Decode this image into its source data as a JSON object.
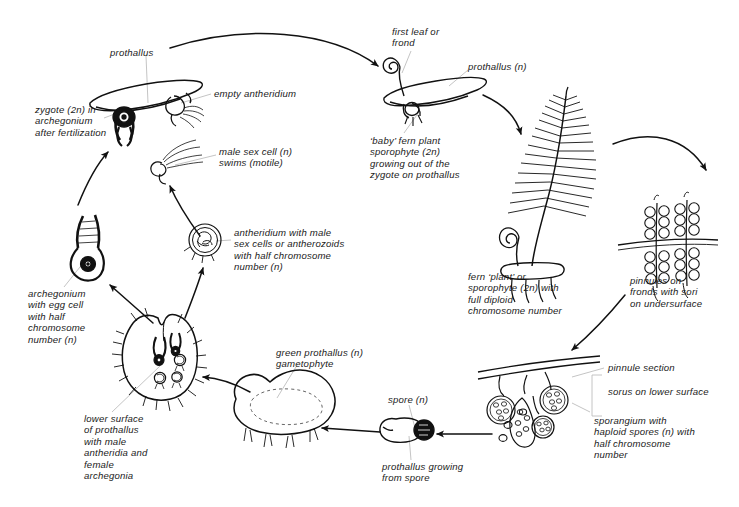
{
  "diagram": {
    "type": "biological-life-cycle-diagram",
    "ink_color": "#111111",
    "leader_color": "#b8b8b8",
    "background": "#ffffff"
  },
  "labels": {
    "prothallus": "prothallus",
    "zygote": "zygote (2n) in\narchegonium\nafter fertilization",
    "empty_antheridium": "empty antheridium",
    "male_sex_cell": "male sex cell (n)\nswims (motile)",
    "antheridium": "antheridium with male\nsex cells or antherozoids\nwith half chromosome\nnumber (n)",
    "archegonium": "archegonium\nwith egg cell\nwith half\nchromosome\nnumber (n)",
    "lower_surface": "lower surface\nof prothallus\nwith male\nantheridia and\nfemale\narchegonia",
    "green_prothallus": "green prothallus (n)\ngametophyte",
    "spore": "spore (n)",
    "prothallus_growing": "prothallus growing\nfrom spore",
    "first_leaf": "first leaf or\nfrond",
    "prothallus_n": "prothallus (n)",
    "baby_fern": "‘baby’ fern plant\nsporophyte (2n)\ngrowing out of the\nzygote on prothallus",
    "fern_plant": "fern ‘plant’ or\nsporophyte (2n) with\nfull diploid\nchromosome number",
    "pinnules": "pinnules on\nfronds with sori\non undersurface",
    "pinnule_section": "pinnule section",
    "sorus": "sorus on lower surface",
    "sporangium": "sporangium with\nhaploid spores (n) with\nhalf chromosome\nnumber"
  },
  "structures": [
    {
      "name": "prothallus-with-zygote",
      "stage": "gametophyte",
      "ploidy": "2n zygote"
    },
    {
      "name": "male-sex-cell",
      "stage": "gamete",
      "ploidy": "n"
    },
    {
      "name": "antheridium",
      "stage": "gametophyte-organ",
      "ploidy": "n"
    },
    {
      "name": "archegonium",
      "stage": "gametophyte-organ",
      "ploidy": "n"
    },
    {
      "name": "heart-shaped-prothallus",
      "stage": "gametophyte",
      "ploidy": "n"
    },
    {
      "name": "green-prothallus",
      "stage": "gametophyte",
      "ploidy": "n"
    },
    {
      "name": "spore",
      "stage": "spore",
      "ploidy": "n"
    },
    {
      "name": "baby-fern-sporophyte",
      "stage": "sporophyte",
      "ploidy": "2n"
    },
    {
      "name": "fern-plant-sporophyte",
      "stage": "sporophyte",
      "ploidy": "2n"
    },
    {
      "name": "pinnules-with-sori",
      "stage": "sporophyte-organ",
      "ploidy": "2n"
    },
    {
      "name": "sporangium-cluster",
      "stage": "sporangium",
      "ploidy": "n spores"
    }
  ]
}
